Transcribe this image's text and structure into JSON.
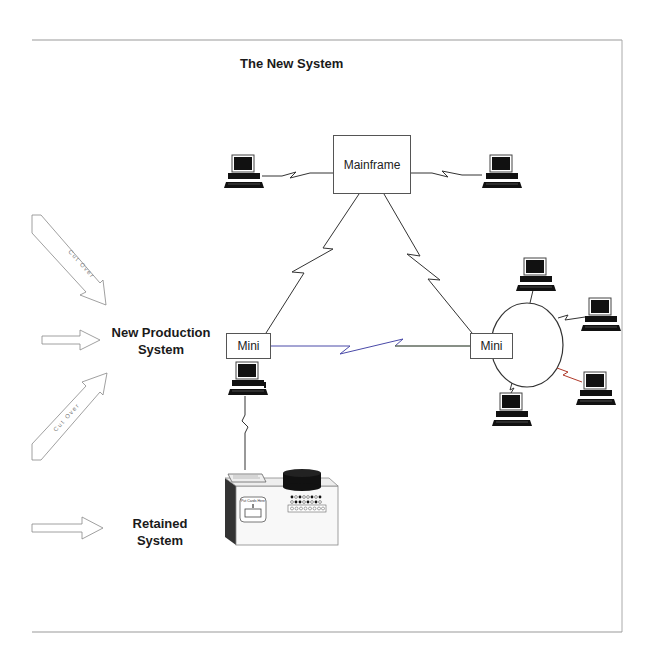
{
  "diagram": {
    "title": "The New System",
    "nodes": {
      "mainframe": "Mainframe",
      "mini_left": "Mini",
      "mini_right": "Mini"
    },
    "labels": {
      "new_production_line1": "New Production",
      "new_production_line2": "System",
      "retained_line1": "Retained",
      "retained_line2": "System"
    },
    "arrows": {
      "cutover_top": "Cut Over",
      "cutover_bottom": "Cut Over"
    },
    "legacy_machine": {
      "slot_label": "Put Cards Here"
    },
    "colors": {
      "line": "#333333",
      "mini_link_left": "#4a4aa8",
      "mini_link_right": "#6a7a3a",
      "ring_link_accent": "#b03a2a",
      "frame": "#999999"
    }
  }
}
